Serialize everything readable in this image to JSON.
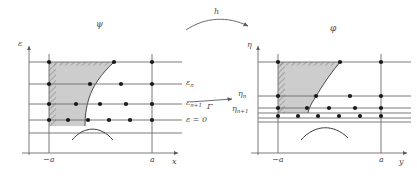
{
  "figure": {
    "title": "",
    "background_color": "#ffffff",
    "line_color": "#6b6b6b",
    "text_color": "#4a4a4a",
    "shade_color": "#c9c9c9",
    "dot_color": "#1a1a1a"
  },
  "left_panel": {
    "map_label": "ψ",
    "vertical_axis_label": "ε",
    "horizontal_axis_label": "x",
    "x_tick_left": "−a",
    "x_tick_right": "a",
    "level_labels": [
      {
        "text_main": "ε",
        "text_sub": "n"
      },
      {
        "text_main": "ε",
        "text_sub": "n+1"
      }
    ],
    "zero_level_label": "ε = 0",
    "epsilon_n_label": "εn",
    "epsilon_n1_label": "εn+1"
  },
  "right_panel": {
    "map_label": "φ",
    "vertical_axis_label": "η",
    "horizontal_axis_label": "y",
    "x_tick_left": "−a",
    "x_tick_right": "a",
    "eta_n_label": "ηn",
    "eta_n1_label": "ηn+1",
    "level_labels": [
      {
        "text_main": "η",
        "text_sub": "n"
      },
      {
        "text_main": "η",
        "text_sub": "n+1"
      }
    ]
  },
  "arrows": {
    "top_arrow_label": "h",
    "middle_arrow_label": "Γ"
  }
}
